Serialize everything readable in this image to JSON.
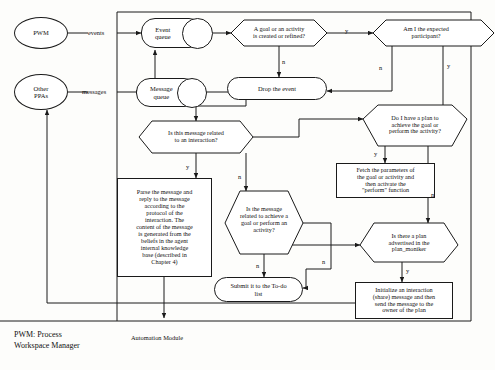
{
  "diagram": {
    "actors": [
      {
        "id": "pwm",
        "label": "PWM"
      },
      {
        "id": "other_ppas",
        "label": "Other\nPPAs"
      }
    ],
    "queues": [
      {
        "id": "event_queue",
        "label": "Event\nqueue"
      },
      {
        "id": "message_queue",
        "label": "Message\nqueue"
      }
    ],
    "decisions": [
      {
        "id": "d_goal_created",
        "label": "A goal or an activity\nis created or refined?"
      },
      {
        "id": "d_expected_participant",
        "label": "Am I the expected\nparticipant?"
      },
      {
        "id": "d_msg_interaction",
        "label": "Is this message related\nto an interaction?"
      },
      {
        "id": "d_have_plan",
        "label": "Do I have a plan to\nachieve the goal or\nperform the activity?"
      },
      {
        "id": "d_msg_goal",
        "label": "Is the message\nrelated to achieve a\ngoal or perform an\nactivity?"
      },
      {
        "id": "d_plan_advertised",
        "label": "Is there a plan\nadvertised in the\nplan_moniker"
      }
    ],
    "processes": [
      {
        "id": "p_drop_event",
        "label": "Drop the event"
      },
      {
        "id": "p_parse_message",
        "label": "Parse the message and\nreply to the message\naccording to the\nprotocol of the\ninteraction. The\ncontent of the message\nis generated from the\nbeliefs in the agent\ninternal knowledge\nbase (described in\nChapter 4)"
      },
      {
        "id": "p_fetch_params",
        "label": "Fetch the parameters of\nthe goal or activity and\nthen activate the\n\"perform\" function"
      },
      {
        "id": "p_submit_todo",
        "label": "Submit it to the To-do\nlist"
      },
      {
        "id": "p_initialize_interaction",
        "label": "Initialize an interaction\n(share) message and then\nsend the message to the\nowner of the plan"
      }
    ],
    "flow_labels": [
      {
        "id": "lbl_events",
        "text": "events"
      },
      {
        "id": "lbl_messages",
        "text": "messages"
      },
      {
        "id": "lbl_goal_yes",
        "text": "y"
      },
      {
        "id": "lbl_goal_no",
        "text": "n"
      },
      {
        "id": "lbl_participant_no",
        "text": "n"
      },
      {
        "id": "lbl_participant_yes",
        "text": "y"
      },
      {
        "id": "lbl_interaction_yes",
        "text": "y"
      },
      {
        "id": "lbl_interaction_no",
        "text": "n"
      },
      {
        "id": "lbl_haveplan_yes",
        "text": "y"
      },
      {
        "id": "lbl_haveplan_no",
        "text": "n"
      },
      {
        "id": "lbl_msggoal_no",
        "text": "n"
      },
      {
        "id": "lbl_msggoal_right_n",
        "text": "n"
      },
      {
        "id": "lbl_planadv_yes",
        "text": "y"
      }
    ],
    "captions": {
      "legend": "PWM: Process\nWorkspace Manager",
      "module": "Automation Module"
    },
    "colors": {
      "stroke": "#1a1a1a",
      "background": "#fdfdfb",
      "text": "#111111"
    }
  }
}
